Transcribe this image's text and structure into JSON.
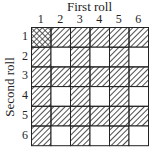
{
  "title": "First roll",
  "ylabel": "Second roll",
  "columns": [
    "1",
    "2",
    "3",
    "4",
    "5",
    "6"
  ],
  "rows": [
    "1",
    "2",
    "3",
    "4",
    "5",
    "6"
  ],
  "cells": [
    [
      "crosshatch",
      "hatched",
      "hatched",
      "hatched",
      "hatched",
      "hatched"
    ],
    [
      "hatched",
      "blank",
      "hatched",
      "blank",
      "hatched",
      "blank"
    ],
    [
      "hatched",
      "hatched",
      "hatched",
      "hatched",
      "hatched",
      "hatched"
    ],
    [
      "hatched",
      "blank",
      "hatched",
      "blank",
      "hatched",
      "blank"
    ],
    [
      "hatched",
      "hatched",
      "hatched",
      "hatched",
      "hatched",
      "hatched"
    ],
    [
      "hatched",
      "blank",
      "hatched",
      "blank",
      "hatched",
      "blank"
    ]
  ],
  "legend": {
    "crosshatch": "both conditions",
    "hatched": "one condition",
    "blank": "neither"
  }
}
